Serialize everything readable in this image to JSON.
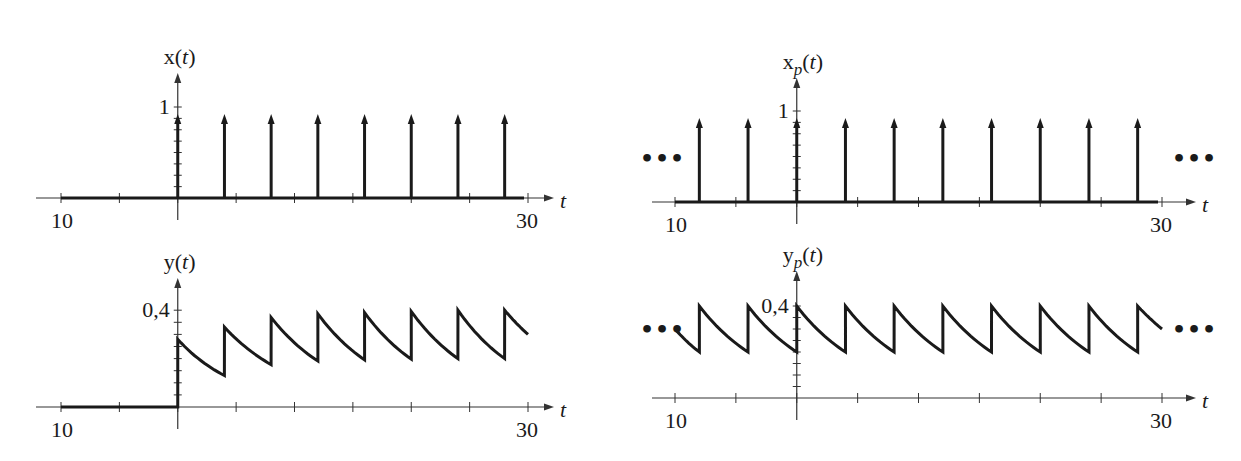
{
  "chart_data": [
    {
      "id": "x",
      "type": "line",
      "subtype": "impulse-train",
      "title": "x(t)",
      "ylabel_main": "x",
      "ylabel_sub": "",
      "ylabel_arg": "t",
      "xlabel": "t",
      "xlim": [
        -10,
        30
      ],
      "tick_labels": {
        "left": "10",
        "right": "30"
      },
      "ytick_label": "1",
      "ytick_value": 1,
      "periodic_dots": false,
      "impulses_t": [
        0,
        4,
        8,
        12,
        16,
        20,
        24,
        28
      ],
      "impulse_height": 1
    },
    {
      "id": "xp",
      "type": "line",
      "subtype": "impulse-train",
      "title": "x_p(t)",
      "ylabel_main": "x",
      "ylabel_sub": "p",
      "ylabel_arg": "t",
      "xlabel": "t",
      "xlim": [
        -10,
        30
      ],
      "tick_labels": {
        "left": "10",
        "right": "30"
      },
      "ytick_label": "1",
      "ytick_value": 1,
      "periodic_dots": true,
      "dots_label": "•••",
      "impulses_t": [
        -8,
        -4,
        0,
        4,
        8,
        12,
        16,
        20,
        24,
        28
      ],
      "impulse_height": 1
    },
    {
      "id": "y",
      "type": "line",
      "title": "y(t)",
      "ylabel_main": "y",
      "ylabel_sub": "",
      "ylabel_arg": "t",
      "xlabel": "t",
      "xlim": [
        -10,
        30
      ],
      "tick_labels": {
        "left": "10",
        "right": "30"
      },
      "ytick_label": "0,4",
      "ytick_value": 0.4,
      "periodic_dots": false,
      "points": [
        [
          -10,
          0
        ],
        [
          0,
          0
        ],
        [
          0,
          0.28
        ],
        [
          4,
          0.13
        ],
        [
          4,
          0.33
        ],
        [
          8,
          0.175
        ],
        [
          8,
          0.37
        ],
        [
          12,
          0.19
        ],
        [
          12,
          0.385
        ],
        [
          16,
          0.195
        ],
        [
          16,
          0.39
        ],
        [
          20,
          0.198
        ],
        [
          20,
          0.395
        ],
        [
          24,
          0.2
        ],
        [
          24,
          0.4
        ],
        [
          28,
          0.2
        ],
        [
          28,
          0.4
        ],
        [
          30,
          0.3
        ]
      ]
    },
    {
      "id": "yp",
      "type": "line",
      "title": "y_p(t)",
      "ylabel_main": "y",
      "ylabel_sub": "p",
      "ylabel_arg": "t",
      "xlabel": "t",
      "xlim": [
        -10,
        30
      ],
      "tick_labels": {
        "left": "10",
        "right": "30"
      },
      "ytick_label": "0,4",
      "ytick_value": 0.4,
      "periodic_dots": true,
      "dots_label": "•••",
      "points": [
        [
          -10,
          0.3
        ],
        [
          -8,
          0.2
        ],
        [
          -8,
          0.4
        ],
        [
          -4,
          0.2
        ],
        [
          -4,
          0.4
        ],
        [
          0,
          0.2
        ],
        [
          0,
          0.4
        ],
        [
          4,
          0.2
        ],
        [
          4,
          0.4
        ],
        [
          8,
          0.2
        ],
        [
          8,
          0.4
        ],
        [
          12,
          0.2
        ],
        [
          12,
          0.4
        ],
        [
          16,
          0.2
        ],
        [
          16,
          0.4
        ],
        [
          20,
          0.2
        ],
        [
          20,
          0.4
        ],
        [
          24,
          0.2
        ],
        [
          24,
          0.4
        ],
        [
          28,
          0.2
        ],
        [
          28,
          0.4
        ],
        [
          30,
          0.3
        ]
      ]
    }
  ]
}
